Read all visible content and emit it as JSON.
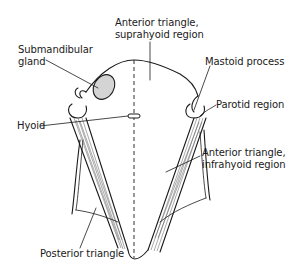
{
  "figure": {
    "labels": {
      "anterior_suprahyoid": [
        "Anterior triangle,",
        "suprahyoid region"
      ],
      "submandibular": [
        "Submandibular",
        "gland"
      ],
      "mastoid": "Mastoid process",
      "parotid": "Parotid region",
      "hyoid": "Hyoid",
      "anterior_infrahyoid": [
        "Anterior triangle,",
        "infrahyoid region"
      ],
      "posterior": "Posterior triangle"
    },
    "colors": {
      "line": "#1a1a1a",
      "gland_fill": "#d4d4d4",
      "background": "#ffffff"
    }
  }
}
